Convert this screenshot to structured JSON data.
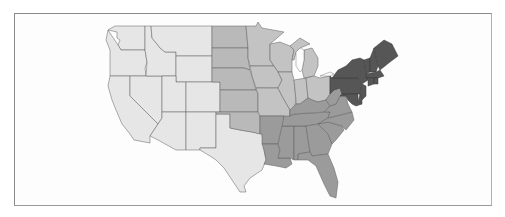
{
  "map": {
    "type": "choropleth",
    "subject": "United States (contiguous) by region",
    "colors": {
      "background": "#ffffff",
      "frame": "#8a8a8a",
      "border": "#5e5e5e",
      "west": "#e6e6e6",
      "plains": "#b9b9b9",
      "midwest": "#c3c3c3",
      "south": "#9b9b9b",
      "northeast": "#565656"
    },
    "regions": [
      {
        "name": "west",
        "shade": "lightest",
        "states": [
          "WA",
          "OR",
          "CA",
          "NV",
          "ID",
          "MT",
          "WY",
          "UT",
          "CO",
          "AZ",
          "NM",
          "TX"
        ]
      },
      {
        "name": "plains",
        "shade": "light",
        "states": [
          "ND",
          "SD",
          "NE",
          "KS",
          "OK"
        ]
      },
      {
        "name": "midwest",
        "shade": "light",
        "states": [
          "MN",
          "IA",
          "MO",
          "WI",
          "IL",
          "MI",
          "IN",
          "OH"
        ]
      },
      {
        "name": "south",
        "shade": "medium",
        "states": [
          "AR",
          "LA",
          "MS",
          "AL",
          "TN",
          "KY",
          "GA",
          "FL",
          "SC",
          "NC",
          "VA",
          "WV"
        ]
      },
      {
        "name": "northeast",
        "shade": "dark",
        "states": [
          "ME",
          "NH",
          "VT",
          "MA",
          "RI",
          "CT",
          "NY",
          "NJ",
          "PA",
          "DE",
          "MD"
        ]
      }
    ]
  }
}
